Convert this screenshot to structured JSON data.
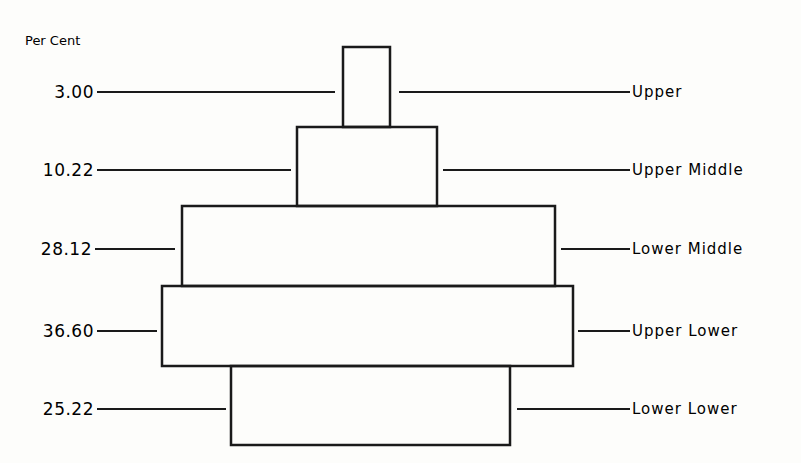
{
  "chart_data": {
    "type": "bar",
    "title": "",
    "ylabel": "Per Cent",
    "orientation": "stacked-pyramid",
    "categories": [
      "Upper",
      "Upper Middle",
      "Lower Middle",
      "Upper Lower",
      "Lower Lower"
    ],
    "values": [
      3.0,
      10.22,
      28.12,
      36.6,
      25.22
    ],
    "value_labels": [
      "3.00",
      "10.22",
      "28.12",
      "36.60",
      "25.22"
    ],
    "legend": null,
    "grid": false
  },
  "geometry": [
    {
      "x": 343,
      "y": 47,
      "w": 47,
      "h": 80,
      "ly": 92,
      "lx1": 97,
      "lx2": 335,
      "rx1": 399,
      "rx2": 630
    },
    {
      "x": 297,
      "y": 127,
      "w": 140,
      "h": 79,
      "ly": 170,
      "lx1": 97,
      "lx2": 291,
      "rx1": 443,
      "rx2": 630
    },
    {
      "x": 182,
      "y": 206,
      "w": 373,
      "h": 80,
      "ly": 249,
      "lx1": 95,
      "lx2": 175,
      "rx1": 561,
      "rx2": 630
    },
    {
      "x": 162,
      "y": 286,
      "w": 411,
      "h": 80,
      "ly": 331,
      "lx1": 97,
      "lx2": 157,
      "rx1": 578,
      "rx2": 630
    },
    {
      "x": 231,
      "y": 366,
      "w": 279,
      "h": 79,
      "ly": 409,
      "lx1": 97,
      "lx2": 226,
      "rx1": 517,
      "rx2": 630
    }
  ]
}
